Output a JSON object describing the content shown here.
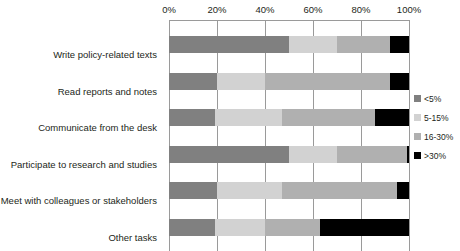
{
  "chart_data": {
    "type": "bar",
    "orientation": "horizontal",
    "stacked": true,
    "stack_mode": "percent",
    "title": "",
    "xlabel": "",
    "ylabel": "",
    "xlim": [
      0,
      100
    ],
    "xticks": [
      0,
      20,
      40,
      60,
      80,
      100
    ],
    "xtick_labels": [
      "0%",
      "20%",
      "40%",
      "60%",
      "80%",
      "100%"
    ],
    "grid": true,
    "grid_axis": "x",
    "legend_position": "right",
    "categories": [
      "Write policy-related texts",
      "Read reports and notes",
      "Communicate from the desk",
      "Participate to research and studies",
      "Meet with colleagues or stakeholders",
      "Other tasks"
    ],
    "series": [
      {
        "name": "<5%",
        "color": "#808080",
        "values": [
          50,
          20,
          19,
          50,
          20,
          19
        ]
      },
      {
        "name": "5-15%",
        "color": "#d2d2d2",
        "values": [
          20,
          20,
          28,
          20,
          27,
          21
        ]
      },
      {
        "name": "16-30%",
        "color": "#b0b0b0",
        "values": [
          22,
          52,
          39,
          29,
          48,
          23
        ]
      },
      {
        "name": ">30%",
        "color": "#000000",
        "values": [
          8,
          8,
          14,
          1,
          5,
          37
        ]
      }
    ]
  }
}
